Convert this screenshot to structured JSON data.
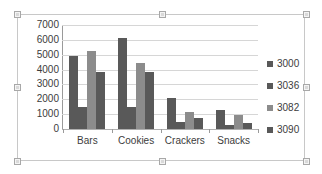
{
  "chart_data": {
    "type": "bar",
    "title": "",
    "subtitle": "",
    "xlabel": "",
    "ylabel": "",
    "categories": [
      "Bars",
      "Cookies",
      "Crackers",
      "Snacks"
    ],
    "series": [
      {
        "name": "3000",
        "color": "#595959",
        "values": [
          4900,
          6150,
          2100,
          1250
        ]
      },
      {
        "name": "3036",
        "color": "#595959",
        "values": [
          1450,
          1450,
          450,
          300
        ]
      },
      {
        "name": "3082",
        "color": "#8c8c8c",
        "values": [
          5250,
          4450,
          1150,
          950
        ]
      },
      {
        "name": "3090",
        "color": "#595959",
        "values": [
          3850,
          3850,
          750,
          400
        ]
      }
    ],
    "ylim": [
      0,
      7000
    ],
    "y_ticks": [
      "0",
      "1000",
      "2000",
      "3000",
      "4000",
      "5000",
      "6000",
      "7000"
    ],
    "y_tick_values": [
      0,
      1000,
      2000,
      3000,
      4000,
      5000,
      6000,
      7000
    ],
    "grid": true,
    "legend_position": "right",
    "legend_entries": [
      "3000",
      "3036",
      "3082",
      "3090"
    ]
  },
  "chart_object": {
    "name": "embedded-chart",
    "selected": true,
    "frame_color": "#c8c8c8",
    "background": "#ffffff"
  }
}
